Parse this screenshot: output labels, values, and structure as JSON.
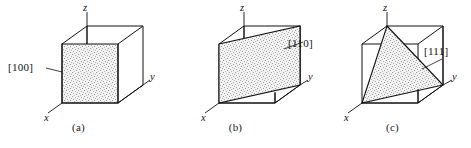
{
  "figure": {
    "background_color": "#ffffff",
    "line_color": "#111111",
    "fill_pattern": "gray-stipple",
    "fill_color": "#e8e8e8"
  },
  "panels": [
    {
      "id": "a",
      "caption": "(a)",
      "index_label": "[100]",
      "plane_type": "face",
      "plane_description": "Shaded front face of the cube, perpendicular to the x axis",
      "axes": {
        "z": "z",
        "y": "y",
        "x": "x"
      }
    },
    {
      "id": "b",
      "caption": "(b)",
      "index_label": "[110]",
      "plane_type": "diagonal",
      "plane_description": "Shaded diagonal plane cutting the cube from the front-left edge to the back-right edge",
      "axes": {
        "z": "z",
        "y": "y",
        "x": "x"
      }
    },
    {
      "id": "c",
      "caption": "(c)",
      "index_label": "[111]",
      "plane_type": "triangular",
      "plane_description": "Shaded triangular plane through the z, x and y axis intercepts",
      "axes": {
        "z": "z",
        "y": "y",
        "x": "x"
      }
    }
  ]
}
